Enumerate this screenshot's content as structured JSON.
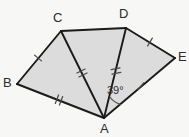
{
  "figure": {
    "type": "geometry-diagram",
    "width": 189,
    "height": 137,
    "background_color": "#f7f7f5",
    "fill_color": "#dcdcdc",
    "stroke_color": "#1a1a1a",
    "tick_color": "#4a4a4a"
  },
  "vertices": [
    {
      "id": "B",
      "label": "B",
      "x": 17,
      "y": 84,
      "label_x": 3,
      "label_y": 76
    },
    {
      "id": "C",
      "label": "C",
      "x": 61,
      "y": 31,
      "label_x": 53,
      "label_y": 11
    },
    {
      "id": "D",
      "label": "D",
      "x": 126,
      "y": 28,
      "label_x": 119,
      "label_y": 7
    },
    {
      "id": "E",
      "label": "E",
      "x": 175,
      "y": 58,
      "label_x": 178,
      "label_y": 50
    },
    {
      "id": "A",
      "label": "A",
      "x": 104,
      "y": 118,
      "label_x": 100,
      "label_y": 122
    }
  ],
  "outline": {
    "points": "17,84 61,31 126,28 175,58 104,118",
    "edges": [
      {
        "name": "BC",
        "from": "B",
        "to": "C",
        "ticks": 1
      },
      {
        "name": "CD",
        "from": "C",
        "to": "D",
        "ticks": 0
      },
      {
        "name": "DE",
        "from": "D",
        "to": "E",
        "ticks": 1
      },
      {
        "name": "EA",
        "from": "E",
        "to": "A",
        "ticks": 1
      },
      {
        "name": "AB",
        "from": "A",
        "to": "B",
        "ticks": 2
      }
    ]
  },
  "diagonals": [
    {
      "name": "CA",
      "from": "C",
      "to": "A",
      "ticks": 2
    },
    {
      "name": "DA",
      "from": "D",
      "to": "A",
      "ticks": 2
    }
  ],
  "tick_marks": [
    {
      "on": "BC",
      "count": 1,
      "x": 38,
      "y": 58,
      "angle": -50
    },
    {
      "on": "DE",
      "count": 1,
      "x": 150,
      "y": 42,
      "angle": 31
    },
    {
      "on": "EA",
      "count": 1,
      "x": 141,
      "y": 86,
      "angle": 40
    },
    {
      "on": "AB",
      "count": 2,
      "x": 59,
      "y": 100,
      "angle": 21
    },
    {
      "on": "CA",
      "count": 2,
      "x": 82,
      "y": 73,
      "angle": 64
    },
    {
      "on": "DA",
      "count": 2,
      "x": 116,
      "y": 71,
      "angle": 79
    }
  ],
  "angles": [
    {
      "id": "angle-DAE",
      "label": "39°",
      "value": 39,
      "unit": "degrees",
      "at_vertex": "A",
      "between": [
        "DA",
        "AE"
      ],
      "label_x": 107,
      "label_y": 85,
      "arc_radius": 22
    }
  ]
}
